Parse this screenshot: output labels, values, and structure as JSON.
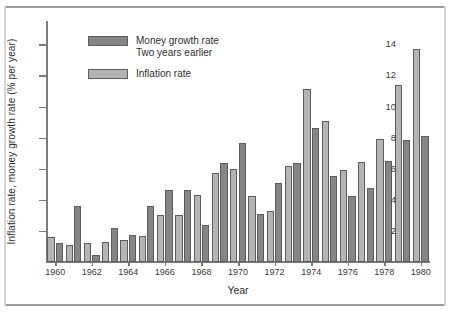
{
  "chart_data": {
    "type": "bar",
    "title": "",
    "subtitle": "",
    "xlabel": "Year",
    "ylabel": "Inflation rate, money growth rate (% per year)",
    "ylim": [
      0,
      15.5
    ],
    "yticks": [
      2,
      4,
      6,
      8,
      10,
      12,
      14
    ],
    "ytick_labels": [
      "2",
      "4",
      "6",
      "8",
      "10",
      "12",
      "14"
    ],
    "grid": false,
    "legend_position": "upper-left-inside",
    "categories": [
      1960,
      1961,
      1962,
      1963,
      1964,
      1965,
      1966,
      1967,
      1968,
      1969,
      1970,
      1971,
      1972,
      1973,
      1974,
      1975,
      1976,
      1977,
      1978,
      1979,
      1980
    ],
    "xtick_labels": [
      "1960",
      "1962",
      "1964",
      "1966",
      "1968",
      "1970",
      "1972",
      "1974",
      "1976",
      "1978",
      "1980"
    ],
    "xticks": [
      1960,
      1962,
      1964,
      1966,
      1968,
      1970,
      1972,
      1974,
      1976,
      1978,
      1980
    ],
    "series": [
      {
        "name": "Inflation rate",
        "color": "#b4b4b4",
        "values": [
          1.6,
          1.1,
          1.2,
          1.3,
          1.4,
          1.7,
          3.0,
          3.0,
          4.3,
          5.7,
          6.0,
          4.25,
          3.25,
          6.2,
          11.1,
          9.05,
          5.9,
          6.45,
          7.9,
          11.4,
          13.7
        ]
      },
      {
        "name": "Money growth rate Two years earlier",
        "color": "#858585",
        "values": [
          1.25,
          3.6,
          0.45,
          2.2,
          1.75,
          3.6,
          4.65,
          4.65,
          2.4,
          6.4,
          7.65,
          3.1,
          5.1,
          6.35,
          8.6,
          5.5,
          4.25,
          4.75,
          6.5,
          7.85,
          8.1
        ]
      }
    ]
  },
  "legend": {
    "money": {
      "label_line1": "Money growth rate",
      "label_line2": "Two years earlier",
      "swatch_name": "money-growth-swatch"
    },
    "inflation": {
      "label_line1": "Inflation rate",
      "swatch_name": "inflation-swatch"
    }
  },
  "axes": {
    "x_title": "Year",
    "y_title": "Inflation rate, money growth rate (% per year)"
  }
}
